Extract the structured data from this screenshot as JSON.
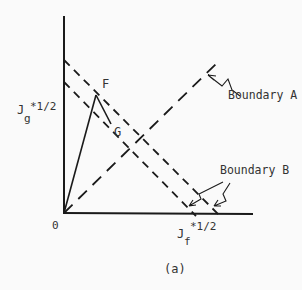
{
  "diagram": {
    "caption": "(a)",
    "origin_label": "0",
    "y_axis": {
      "base": "J",
      "subscript": "g",
      "superscript": "*1/2"
    },
    "x_axis": {
      "base": "J",
      "subscript": "f",
      "superscript": "*1/2"
    },
    "points": [
      {
        "id": "F",
        "label": "F"
      },
      {
        "id": "G",
        "label": "G"
      }
    ],
    "boundaries": [
      {
        "id": "A",
        "label": "Boundary A",
        "style": "long-dashed line from origin"
      },
      {
        "id": "B",
        "label": "Boundary B",
        "style": "two parallel dashed lines"
      }
    ],
    "colors": {
      "ink": "#1a1a1a",
      "background": "#fafafa"
    }
  }
}
